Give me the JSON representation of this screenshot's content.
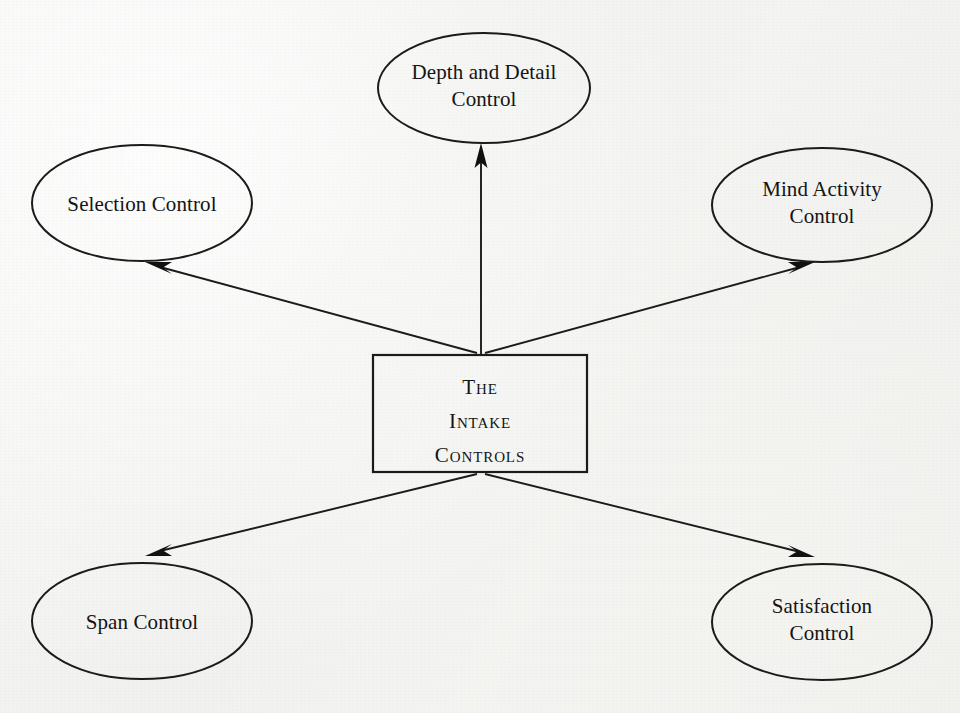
{
  "diagram": {
    "title": "The Intake Controls",
    "type": "hub-and-spoke",
    "background_color": "#f3f3f1",
    "line_color": "#1b1b1b",
    "text_color": "#141414",
    "center": {
      "id": "the-intake-controls",
      "shape": "rectangle",
      "lines": [
        "The",
        "Intake",
        "Controls"
      ],
      "text_style": "small-caps",
      "x": 373,
      "y": 355,
      "width": 214,
      "height": 117
    },
    "nodes": [
      {
        "id": "depth-and-detail-control",
        "label": "Depth and Detail\nControl",
        "shape": "ellipse",
        "position": "top",
        "cx": 484,
        "cy": 88,
        "rx": 106,
        "ry": 55
      },
      {
        "id": "selection-control",
        "label": "Selection Control",
        "shape": "ellipse",
        "position": "top-left",
        "cx": 142,
        "cy": 203,
        "rx": 110,
        "ry": 58
      },
      {
        "id": "mind-activity-control",
        "label": "Mind Activity\nControl",
        "shape": "ellipse",
        "position": "top-right",
        "cx": 822,
        "cy": 205,
        "rx": 110,
        "ry": 57
      },
      {
        "id": "span-control",
        "label": "Span Control",
        "shape": "ellipse",
        "position": "bottom-left",
        "cx": 142,
        "cy": 621,
        "rx": 110,
        "ry": 58
      },
      {
        "id": "satisfaction-control",
        "label": "Satisfaction\nControl",
        "shape": "ellipse",
        "position": "bottom-right",
        "cx": 822,
        "cy": 622,
        "rx": 110,
        "ry": 58
      }
    ],
    "connectors": [
      {
        "id": "arrow-to-depth-and-detail-control",
        "from": "the-intake-controls",
        "to": "depth-and-detail-control",
        "direction": "up",
        "arrowhead": "target",
        "path": "M 481,354 L 481,150"
      },
      {
        "id": "arrow-to-selection-control",
        "from": "the-intake-controls",
        "to": "selection-control",
        "direction": "up-left",
        "arrowhead": "target",
        "path": "M 477,353 L 150,265"
      },
      {
        "id": "arrow-to-mind-activity-control",
        "from": "the-intake-controls",
        "to": "mind-activity-control",
        "direction": "up-right",
        "arrowhead": "target",
        "path": "M 485,353 L 811,265"
      },
      {
        "id": "arrow-to-span-control",
        "from": "the-intake-controls",
        "to": "span-control",
        "direction": "down-left",
        "arrowhead": "target",
        "path": "M 477,474 L 150,553"
      },
      {
        "id": "arrow-to-satisfaction-control",
        "from": "the-intake-controls",
        "to": "satisfaction-control",
        "direction": "down-right",
        "arrowhead": "target",
        "path": "M 485,474 L 811,554"
      }
    ]
  }
}
